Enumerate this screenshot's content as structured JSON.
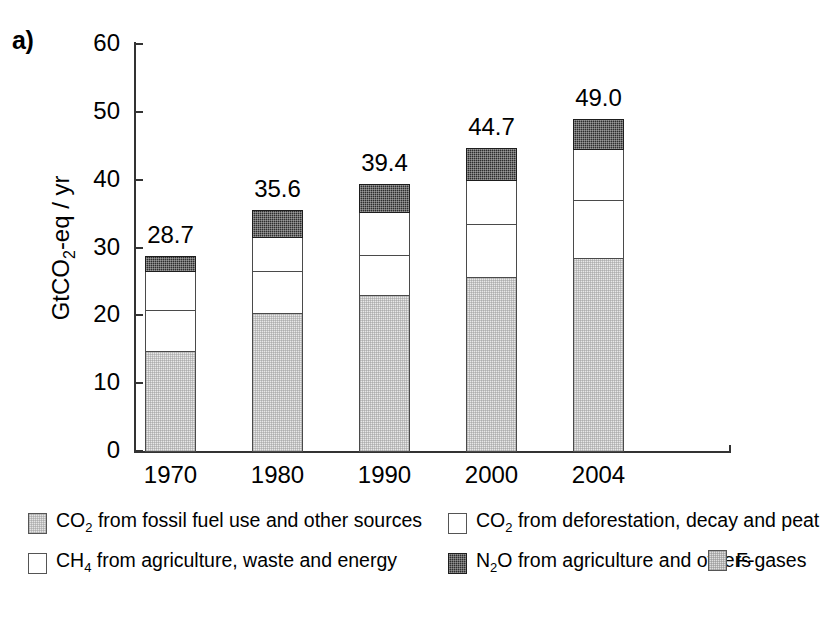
{
  "panel_label": "a)",
  "chart_data": {
    "type": "bar",
    "subtype": "stacked",
    "title": "",
    "xlabel": "",
    "ylabel": "GtCO2-eq / yr",
    "ylabel_parts": {
      "pre": "GtCO",
      "sub": "2",
      "post": "-eq / yr"
    },
    "ylim": [
      0,
      60
    ],
    "yticks": [
      0,
      10,
      20,
      30,
      40,
      50,
      60
    ],
    "ytick_labels": [
      "0",
      "10",
      "20",
      "30",
      "40",
      "50",
      "60"
    ],
    "grid": false,
    "legend_position": "bottom",
    "categories": [
      "1970",
      "1980",
      "1990",
      "2000",
      "2004"
    ],
    "series": [
      {
        "name": "CO2 from fossil fuel use and other sources",
        "key": "fossil",
        "color": "#e8e8e8",
        "values": [
          14.7,
          20.3,
          23.0,
          25.7,
          28.5
        ]
      },
      {
        "name": "CO2 from deforestation, decay and peat",
        "key": "deforestation",
        "color": "#ffffff",
        "values": [
          6.1,
          6.2,
          5.9,
          7.8,
          8.5
        ]
      },
      {
        "name": "CH4 from agriculture, waste and energy",
        "key": "ch4",
        "color": "#ffffff",
        "values": [
          5.8,
          5.1,
          6.3,
          6.5,
          7.5
        ]
      },
      {
        "name": "N2O from agriculture and others",
        "key": "n2o",
        "color": "#2e2e2e",
        "values": [
          2.1,
          4.0,
          4.2,
          4.7,
          4.5
        ]
      }
    ],
    "totals": [
      28.7,
      35.6,
      39.4,
      44.7,
      49.0
    ],
    "total_labels": [
      "28.7",
      "35.6",
      "39.4",
      "44.7",
      "49.0"
    ]
  },
  "legend": {
    "entries": [
      {
        "label_pre": "CO",
        "label_sub": "2",
        "label_post": " from fossil fuel use and other sources",
        "swatch": "fossil"
      },
      {
        "label_pre": "CO",
        "label_sub": "2",
        "label_post": " from deforestation, decay and peat",
        "swatch": "white"
      },
      {
        "label_pre": "CH",
        "label_sub": "4",
        "label_post": " from agriculture, waste and energy",
        "swatch": "white"
      },
      {
        "label_pre": "N",
        "label_sub": "2",
        "label_post": "O from agriculture and others",
        "swatch": "dark"
      },
      {
        "label_pre": "F-gases",
        "label_sub": "",
        "label_post": "",
        "swatch": "fgas"
      }
    ]
  }
}
